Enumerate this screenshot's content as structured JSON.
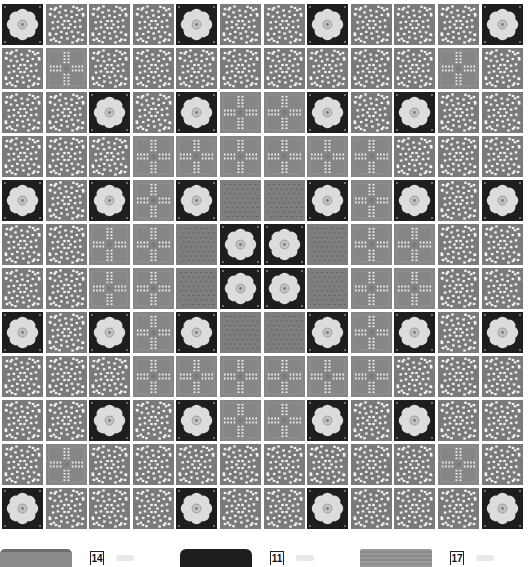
{
  "diagram": {
    "rows": 12,
    "cols": 12,
    "tile_types": {
      "F": "flower",
      "L": "lace",
      "C": "cross",
      "T": "texture"
    },
    "layout": [
      "FLLLFLLFLLLF",
      "LCLLLLLLLLCL",
      "LLFLFCCFLFLL",
      "LLLCCCCCCLLL",
      "FLFCFTTFCFLF",
      "LLCCTFFTCCLL",
      "LLCCTFFTCCLL",
      "FLFCFTTFCFLF",
      "LLLCCCCCCLLL",
      "LLFLFCCFLFLL",
      "LCLLLLLLLLCL",
      "FLLLFLLFLLLF"
    ],
    "colors": {
      "flower_bg": "#1e1e1e",
      "flower_petal": "#dcdcdc",
      "lace_bg": "#7a7a7a",
      "cross_bg": "#868686",
      "texture_bg": "#7e7e7e",
      "gap": "#ffffff"
    }
  },
  "legend": [
    {
      "swatch": "lace",
      "number": "14"
    },
    {
      "swatch": "flower",
      "number": "11"
    },
    {
      "swatch": "cross",
      "number": "17"
    }
  ]
}
